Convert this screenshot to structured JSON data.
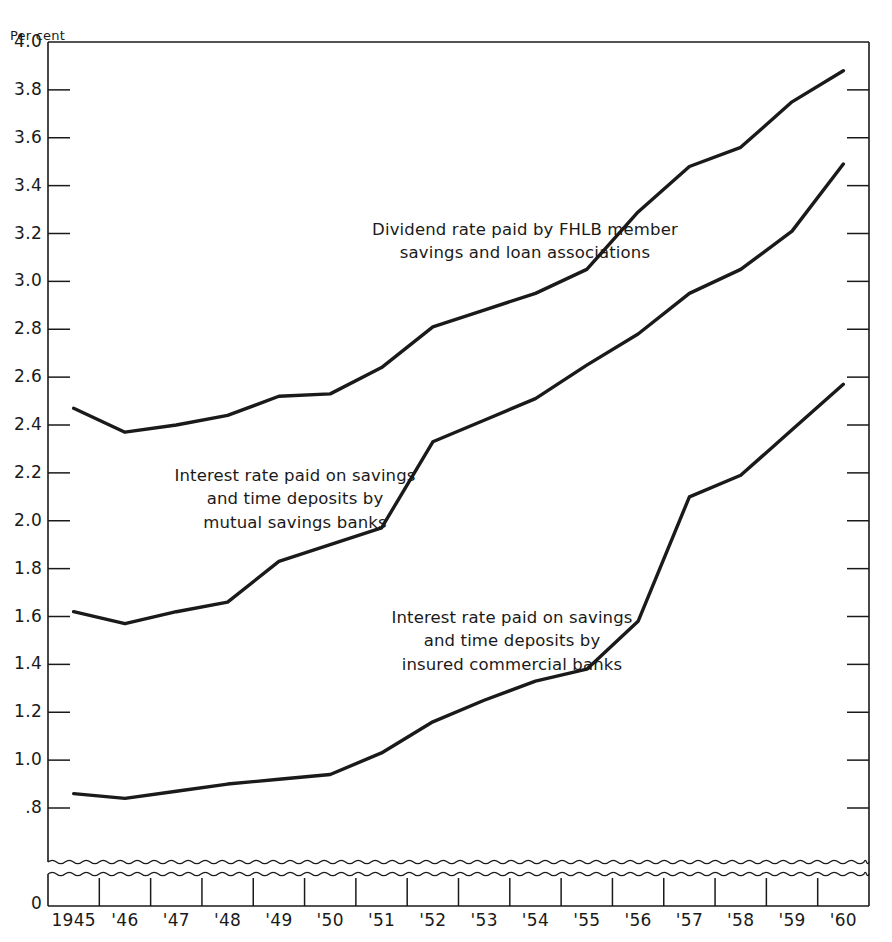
{
  "chart_data": {
    "type": "line",
    "title": "",
    "subtitle": "",
    "xlabel": "",
    "ylabel": "Per cent",
    "ylim": [
      0.8,
      4.0
    ],
    "ytick_step": 0.2,
    "grid": false,
    "legend_position": "inline-annotations",
    "axis_break": true,
    "axis_break_note": "wavy break between 0 and .8",
    "x": [
      "1945",
      "1946",
      "1947",
      "1948",
      "1949",
      "1950",
      "1951",
      "1952",
      "1953",
      "1954",
      "1955",
      "1956",
      "1957",
      "1958",
      "1959",
      "1960"
    ],
    "xtick_labels": [
      "1945",
      "'46",
      "'47",
      "'48",
      "'49",
      "'50",
      "'51",
      "'52",
      "'53",
      "'54",
      "'55",
      "'56",
      "'57",
      "'58",
      "'59",
      "'60"
    ],
    "ytick_labels": [
      "4.0",
      "3.8",
      "3.6",
      "3.4",
      "3.2",
      "3.0",
      "2.8",
      "2.6",
      "2.4",
      "2.2",
      "2.0",
      "1.8",
      "1.6",
      "1.4",
      "1.2",
      "1.0",
      ".8"
    ],
    "ytick_values": [
      4.0,
      3.8,
      3.6,
      3.4,
      3.2,
      3.0,
      2.8,
      2.6,
      2.4,
      2.2,
      2.0,
      1.8,
      1.6,
      1.4,
      1.2,
      1.0,
      0.8
    ],
    "zero_label": "0",
    "series": [
      {
        "name": "Dividend rate paid by FHLB member savings and loan associations",
        "values": [
          2.47,
          2.37,
          2.4,
          2.44,
          2.52,
          2.53,
          2.64,
          2.81,
          2.88,
          2.95,
          3.05,
          3.29,
          3.48,
          3.56,
          3.75,
          3.88
        ]
      },
      {
        "name": "Interest rate paid on savings and time deposits by mutual savings banks",
        "values": [
          1.62,
          1.57,
          1.62,
          1.66,
          1.83,
          1.9,
          1.97,
          2.33,
          2.42,
          2.51,
          2.65,
          2.78,
          2.95,
          3.05,
          3.21,
          3.49
        ]
      },
      {
        "name": "Interest rate paid on savings and time deposits by insured commercial banks",
        "values": [
          0.86,
          0.84,
          0.87,
          0.9,
          0.92,
          0.94,
          1.03,
          1.16,
          1.25,
          1.33,
          1.38,
          1.58,
          2.1,
          2.19,
          2.38,
          2.57
        ]
      }
    ],
    "annotations": [
      {
        "id": "fhlb",
        "lines": [
          "Dividend rate paid by FHLB member",
          "savings and loan associations"
        ],
        "x": 525,
        "y": 218
      },
      {
        "id": "mutual-savings",
        "lines": [
          "Interest rate paid on savings",
          "and time deposits by",
          "mutual savings banks"
        ],
        "x": 295,
        "y": 464
      },
      {
        "id": "commercial",
        "lines": [
          "Interest rate paid on savings",
          "and time deposits by",
          "insured commercial banks"
        ],
        "x": 512,
        "y": 606
      }
    ],
    "colors": {
      "line": "#1a1a1a",
      "axis": "#1a1a1a",
      "background": "#ffffff"
    }
  }
}
